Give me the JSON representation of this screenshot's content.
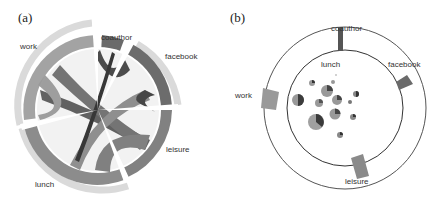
{
  "panels": [
    {
      "id": "a",
      "label": "(a)",
      "type": "chord-diagram",
      "categories": [
        {
          "name": "work",
          "label": "work"
        },
        {
          "name": "coauthor",
          "label": "coauthor"
        },
        {
          "name": "facebook",
          "label": "facebook"
        },
        {
          "name": "leisure",
          "label": "leisure"
        },
        {
          "name": "lunch",
          "label": "lunch"
        }
      ]
    },
    {
      "id": "b",
      "label": "(b)",
      "type": "ring-with-bubble-pies",
      "outer_labels": [
        {
          "name": "coauthor",
          "label": "coauthor"
        },
        {
          "name": "facebook",
          "label": "facebook"
        },
        {
          "name": "work",
          "label": "work"
        },
        {
          "name": "leisure",
          "label": "leisure"
        }
      ],
      "inner_label": "lunch",
      "bubble_count": 13
    }
  ],
  "colors": {
    "dark": "#3a3a3a",
    "mid_dark": "#5e5e5e",
    "mid": "#8a8a8a",
    "light": "#a9a9a9",
    "pale": "#d9d9d9",
    "ring_line": "#444444"
  }
}
